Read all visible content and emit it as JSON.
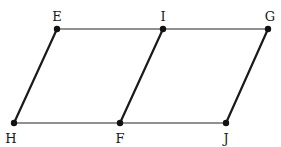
{
  "diagram": {
    "type": "geometry",
    "points": [
      {
        "name": "E",
        "x": 57,
        "y": 29,
        "lx": 57,
        "ly": 21
      },
      {
        "name": "I",
        "x": 163,
        "y": 29,
        "lx": 163,
        "ly": 21
      },
      {
        "name": "G",
        "x": 268,
        "y": 29,
        "lx": 270,
        "ly": 21
      },
      {
        "name": "H",
        "x": 14,
        "y": 123,
        "lx": 11,
        "ly": 143
      },
      {
        "name": "F",
        "x": 120,
        "y": 123,
        "lx": 120,
        "ly": 143
      },
      {
        "name": "J",
        "x": 226,
        "y": 123,
        "lx": 226,
        "ly": 143
      }
    ],
    "segments": [
      {
        "from": "E",
        "to": "G",
        "style": "thin"
      },
      {
        "from": "H",
        "to": "J",
        "style": "thin"
      },
      {
        "from": "E",
        "to": "H",
        "style": "thick"
      },
      {
        "from": "I",
        "to": "F",
        "style": "thick"
      },
      {
        "from": "G",
        "to": "J",
        "style": "thick"
      }
    ],
    "colors": {
      "thin_line": "#6e6e6e",
      "thick_line": "#1a1a1a",
      "point": "#111111"
    }
  }
}
